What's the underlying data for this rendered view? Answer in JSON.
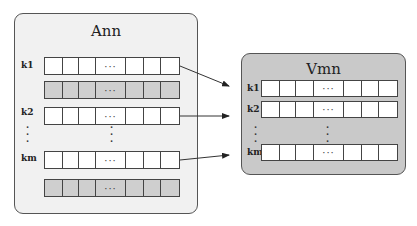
{
  "ann": {
    "title": "Ann",
    "labels": [
      "k1",
      "k2",
      "km"
    ],
    "ellipsis_h": "···",
    "vdots": "·\n·\n·"
  },
  "vmn": {
    "title": "Vmn",
    "labels": [
      "k1",
      "k2",
      "km"
    ],
    "ellipsis_h": "···",
    "vdots": "·\n·\n·"
  },
  "colors": {
    "ann_bg": "#f1f1f1",
    "vmn_bg": "#c9c9c9",
    "shaded_row": "#cfcfcf",
    "stroke": "#444444"
  }
}
